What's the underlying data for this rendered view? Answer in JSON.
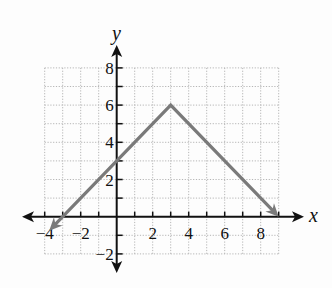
{
  "chart_data": {
    "type": "line",
    "title": "",
    "xlabel": "x",
    "ylabel": "y",
    "xlim": [
      -4,
      9
    ],
    "ylim": [
      -2,
      8
    ],
    "grid": true,
    "legend": null,
    "x_ticks": [
      -4,
      -2,
      2,
      4,
      6,
      8
    ],
    "y_ticks": [
      -2,
      2,
      4,
      6,
      8
    ],
    "x_tick_labels": [
      "−4",
      "−2",
      "2",
      "4",
      "6",
      "8"
    ],
    "y_tick_labels": [
      "−2",
      "2",
      "4",
      "6",
      "8"
    ],
    "series": [
      {
        "name": "piecewise-linear",
        "description": "Absolute-value-shaped graph with vertex at (3, 6), arrows on both ends",
        "x": [
          -3.75,
          0,
          3,
          9
        ],
        "y": [
          -0.75,
          3,
          6,
          0
        ],
        "vertex": [
          3,
          6
        ],
        "y_intercept": 3,
        "x_intercepts": [
          -3,
          9
        ],
        "color": "#7a7a7a"
      }
    ]
  },
  "labels": {
    "x_axis": "x",
    "y_axis": "y"
  },
  "colors": {
    "background": "#fdfdfd",
    "axis": "#111111",
    "grid": "#b5b5b5",
    "line": "#7a7a7a"
  }
}
